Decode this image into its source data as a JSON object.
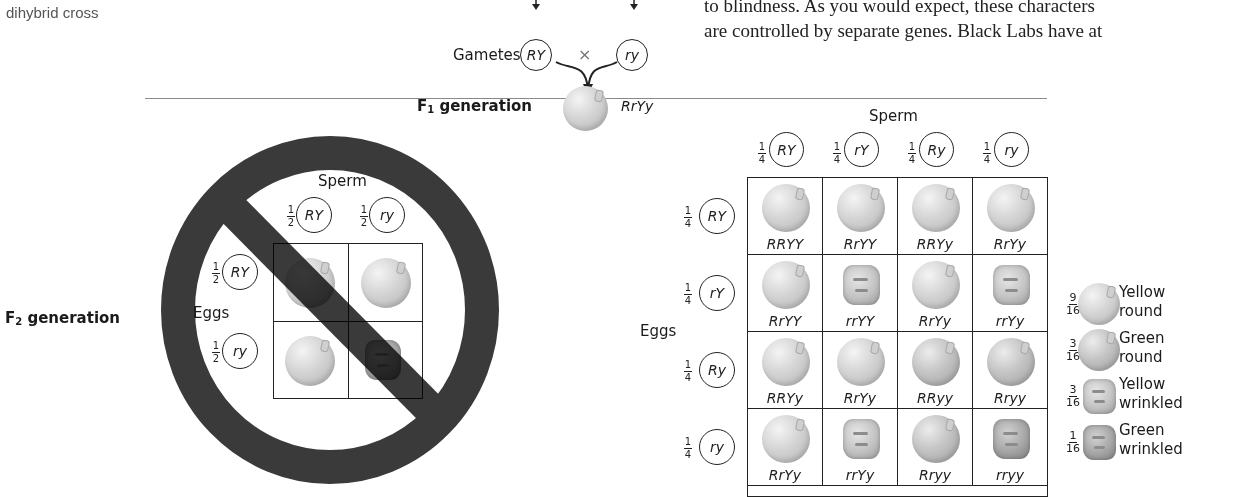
{
  "caption": "dihybrid cross",
  "body_text": {
    "line1": "to blindness. As you would expect, these characters",
    "line2": "are controlled by separate genes. Black Labs have at"
  },
  "parents": {
    "gametes_label": "Gametes",
    "gamete_left": "RY",
    "cross_symbol": "×",
    "gamete_right": "ry"
  },
  "f1": {
    "label_prefix": "F",
    "label_sub": "1",
    "label_suffix": " generation",
    "genotype": "RrYy"
  },
  "f2": {
    "label_prefix": "F",
    "label_sub": "2",
    "label_suffix": " generation"
  },
  "incorrect_square": {
    "sperm_label": "Sperm",
    "eggs_label": "Eggs",
    "sperm": [
      {
        "num": "1",
        "den": "2",
        "allele": "RY"
      },
      {
        "num": "1",
        "den": "2",
        "allele": "ry"
      }
    ],
    "eggs": [
      {
        "num": "1",
        "den": "2",
        "allele": "RY"
      },
      {
        "num": "1",
        "den": "2",
        "allele": "ry"
      }
    ],
    "cells": [
      [
        "yellow-round",
        "yellow-round"
      ],
      [
        "yellow-round",
        "green-wrinkled"
      ]
    ],
    "overlay": "prohibition-sign"
  },
  "correct_square": {
    "sperm_label": "Sperm",
    "eggs_label": "Eggs",
    "sperm": [
      {
        "num": "1",
        "den": "4",
        "allele": "RY"
      },
      {
        "num": "1",
        "den": "4",
        "allele": "rY"
      },
      {
        "num": "1",
        "den": "4",
        "allele": "Ry"
      },
      {
        "num": "1",
        "den": "4",
        "allele": "ry"
      }
    ],
    "eggs": [
      {
        "num": "1",
        "den": "4",
        "allele": "RY"
      },
      {
        "num": "1",
        "den": "4",
        "allele": "rY"
      },
      {
        "num": "1",
        "den": "4",
        "allele": "Ry"
      },
      {
        "num": "1",
        "den": "4",
        "allele": "ry"
      }
    ],
    "rows": [
      [
        {
          "genotype": "RRYY",
          "phenotype": "yellow-round"
        },
        {
          "genotype": "RrYY",
          "phenotype": "yellow-round"
        },
        {
          "genotype": "RRYy",
          "phenotype": "yellow-round"
        },
        {
          "genotype": "RrYy",
          "phenotype": "yellow-round"
        }
      ],
      [
        {
          "genotype": "RrYY",
          "phenotype": "yellow-round"
        },
        {
          "genotype": "rrYY",
          "phenotype": "yellow-wrinkled"
        },
        {
          "genotype": "RrYy",
          "phenotype": "yellow-round"
        },
        {
          "genotype": "rrYy",
          "phenotype": "yellow-wrinkled"
        }
      ],
      [
        {
          "genotype": "RRYy",
          "phenotype": "yellow-round"
        },
        {
          "genotype": "RrYy",
          "phenotype": "yellow-round"
        },
        {
          "genotype": "RRyy",
          "phenotype": "green-round"
        },
        {
          "genotype": "Rryy",
          "phenotype": "green-round"
        }
      ],
      [
        {
          "genotype": "RrYy",
          "phenotype": "yellow-round"
        },
        {
          "genotype": "rrYy",
          "phenotype": "yellow-wrinkled"
        },
        {
          "genotype": "Rryy",
          "phenotype": "green-round"
        },
        {
          "genotype": "rryy",
          "phenotype": "green-wrinkled"
        }
      ]
    ]
  },
  "legend": [
    {
      "num": "9",
      "den": "16",
      "line1": "Yellow",
      "line2": "round",
      "phenotype": "yellow-round"
    },
    {
      "num": "3",
      "den": "16",
      "line1": "Green",
      "line2": "round",
      "phenotype": "green-round"
    },
    {
      "num": "3",
      "den": "16",
      "line1": "Yellow",
      "line2": "wrinkled",
      "phenotype": "yellow-wrinkled"
    },
    {
      "num": "1",
      "den": "16",
      "line1": "Green",
      "line2": "wrinkled",
      "phenotype": "green-wrinkled"
    }
  ]
}
